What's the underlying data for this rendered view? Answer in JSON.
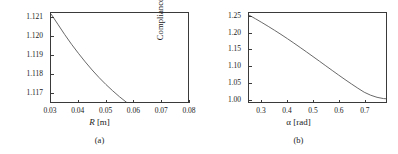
{
  "figure": {
    "panels": [
      {
        "caption": "(a)",
        "ylabel": "Compliance ratio",
        "xlabel_symbol": "R",
        "xlabel_unit": "[m]"
      },
      {
        "caption": "(b)",
        "ylabel": "Compliance ratio",
        "xlabel_symbol": "α",
        "xlabel_unit": "[rad]"
      }
    ]
  },
  "chart_data": [
    {
      "type": "line",
      "panel": "(a)",
      "title": "",
      "xlabel": "R [m]",
      "ylabel": "Compliance ratio",
      "xlim": [
        0.03,
        0.08
      ],
      "ylim": [
        1.1165,
        1.12125
      ],
      "xticks": [
        0.03,
        0.04,
        0.05,
        0.06,
        0.07,
        0.08
      ],
      "xtick_labels": [
        "0.03",
        "0.04",
        "0.05",
        "0.06",
        "0.07",
        "0.08"
      ],
      "yticks": [
        1.117,
        1.118,
        1.119,
        1.12,
        1.121
      ],
      "ytick_labels": [
        "1.117",
        "1.118",
        "1.119",
        "1.120",
        "1.121"
      ],
      "grid": false,
      "legend": false,
      "line_color": "#555555",
      "series": [
        {
          "name": "compliance ratio vs R",
          "x": [
            0.03,
            0.0325,
            0.035,
            0.0375,
            0.04,
            0.0425,
            0.045,
            0.0475,
            0.05,
            0.0525,
            0.055,
            0.0575,
            0.06,
            0.0625,
            0.065,
            0.0675,
            0.07,
            0.0725,
            0.075,
            0.0775,
            0.08
          ],
          "y": [
            1.1212,
            1.12065,
            1.1201,
            1.11958,
            1.1191,
            1.11864,
            1.11821,
            1.11781,
            1.11744,
            1.1171,
            1.11678,
            1.11649,
            1.11622,
            1.11597,
            1.11575,
            1.11555,
            1.11537,
            1.11521,
            1.11507,
            1.11494,
            1.11483
          ]
        }
      ]
    },
    {
      "type": "line",
      "panel": "(b)",
      "title": "",
      "xlabel": "α [rad]",
      "ylabel": "Compliance ratio",
      "xlim": [
        0.25,
        0.785
      ],
      "ylim": [
        0.99,
        1.262
      ],
      "xticks": [
        0.3,
        0.4,
        0.5,
        0.6,
        0.7
      ],
      "xtick_labels": [
        "0.3",
        "0.4",
        "0.5",
        "0.6",
        "0.7"
      ],
      "yticks": [
        1.0,
        1.05,
        1.1,
        1.15,
        1.2,
        1.25
      ],
      "ytick_labels": [
        "1.00",
        "1.05",
        "1.10",
        "1.15",
        "1.20",
        "1.25"
      ],
      "grid": false,
      "legend": false,
      "line_color": "#555555",
      "series": [
        {
          "name": "compliance ratio vs alpha",
          "x": [
            0.25,
            0.275,
            0.3,
            0.325,
            0.35,
            0.375,
            0.4,
            0.425,
            0.45,
            0.475,
            0.5,
            0.525,
            0.55,
            0.575,
            0.6,
            0.625,
            0.65,
            0.675,
            0.7,
            0.725,
            0.75,
            0.775,
            0.785
          ],
          "y": [
            1.2555,
            1.2445,
            1.233,
            1.2212,
            1.209,
            1.1965,
            1.1835,
            1.1702,
            1.1566,
            1.1428,
            1.1288,
            1.1147,
            1.1005,
            1.0864,
            1.0724,
            1.0586,
            1.0452,
            1.0322,
            1.0198,
            1.0108,
            1.0043,
            1.0005,
            1.0
          ]
        }
      ]
    }
  ]
}
